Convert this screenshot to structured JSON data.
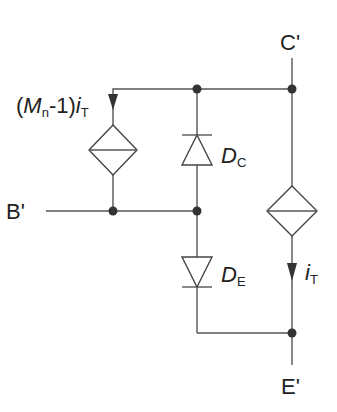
{
  "diagram": {
    "type": "equivalent-circuit",
    "terminals": {
      "collector": "C'",
      "base": "B'",
      "emitter": "E'"
    },
    "labels": {
      "controlled_source_left": {
        "prefix": "(",
        "M": "M",
        "M_sub": "n",
        "mid": "-1)",
        "i": "i",
        "i_sub": "T"
      },
      "diode_collector": {
        "main": "D",
        "sub": "C"
      },
      "diode_emitter": {
        "main": "D",
        "sub": "E"
      },
      "current_right": {
        "main": "i",
        "sub": "T"
      }
    },
    "components": [
      {
        "id": "left-source",
        "kind": "controlled-current-source",
        "label": "(Mn-1)iT",
        "direction": "down"
      },
      {
        "id": "DC",
        "kind": "diode",
        "label": "DC",
        "orientation": "anode-bottom-cathode-top"
      },
      {
        "id": "DE",
        "kind": "diode",
        "label": "DE",
        "orientation": "anode-top-cathode-bottom"
      },
      {
        "id": "right-source",
        "kind": "controlled-current-source",
        "label": "iT",
        "direction": "down"
      }
    ],
    "colors": {
      "line": "#555555",
      "node": "#333333",
      "text": "#222222"
    }
  }
}
